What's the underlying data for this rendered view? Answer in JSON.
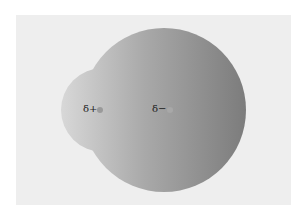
{
  "diagram": {
    "title": "",
    "background_color": "#eeeeee",
    "molecule": {
      "small_lobe": {
        "cx": 103,
        "cy": 110,
        "r": 42,
        "color_light": "#d6d6d6",
        "color_dark": "#b8b8b8"
      },
      "large_lobe": {
        "cx": 164,
        "cy": 110,
        "r": 82,
        "color_light": "#b4b4b4",
        "color_dark": "#7f7f7f"
      }
    },
    "atoms": [
      {
        "label": "δ+",
        "dot_x": 100,
        "dot_y": 110,
        "dot_color": "#9a9a9a"
      },
      {
        "label": "δ−",
        "dot_x": 170,
        "dot_y": 110,
        "dot_color": "#a8a8a8"
      }
    ]
  }
}
